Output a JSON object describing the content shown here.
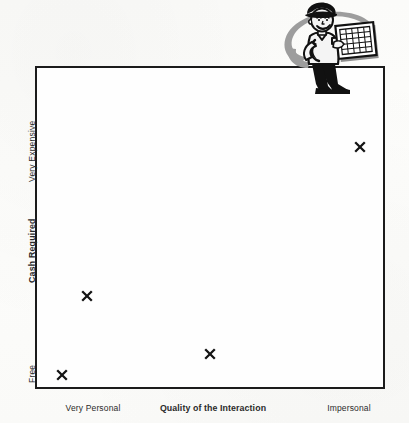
{
  "chart_data": {
    "type": "scatter",
    "title": "",
    "xlabel": "Quality of the Interaction",
    "ylabel": "Cash Required",
    "x_axis": {
      "label": "Quality of the Interaction",
      "left_tick": "Very Personal",
      "right_tick": "Impersonal",
      "range_text": [
        "Very Personal",
        "Impersonal"
      ]
    },
    "y_axis": {
      "label": "Cash Required",
      "top_tick": "Very Expensive",
      "bottom_tick": "Free",
      "range_text": [
        "Free",
        "Very Expensive"
      ]
    },
    "grid": false,
    "legend": null,
    "marker_symbol": "x",
    "points": [
      {
        "id": "point-1",
        "x_pct": 7.1,
        "y_pct": 5.0,
        "x_qualitative": "Very Personal",
        "y_qualitative": "Free"
      },
      {
        "id": "point-2",
        "x_pct": 14.3,
        "y_pct": 29.4,
        "x_qualitative": "Very Personal",
        "y_qualitative": "Low"
      },
      {
        "id": "point-3",
        "x_pct": 49.4,
        "y_pct": 11.5,
        "x_qualitative": "Middle",
        "y_qualitative": "Near Free"
      },
      {
        "id": "point-4",
        "x_pct": 92.3,
        "y_pct": 75.5,
        "x_qualitative": "Impersonal",
        "y_qualitative": "Very Expensive"
      }
    ]
  },
  "axes": {
    "x": {
      "left": "Very Personal",
      "center_bold": "Quality of the Interaction",
      "right": "Impersonal"
    },
    "y": {
      "top": "Very Expensive",
      "center_bold": "Cash Required",
      "bottom": "Free"
    }
  },
  "illustration": {
    "name": "cartoon-man-holding-grid-chart",
    "description": "Retro clip-art businessman in hat carrying a grid board, gray swoosh behind",
    "colors": {
      "ink": "#111111",
      "swoosh": "#9a9a9a",
      "skin": "#f2f2f2",
      "board": "#ffffff"
    }
  },
  "colors": {
    "frame": "#1b1b1b",
    "marker": "#141414",
    "text": "#2a2a2a",
    "background": "#fdfdfc",
    "plot_background": "#fefefe"
  }
}
